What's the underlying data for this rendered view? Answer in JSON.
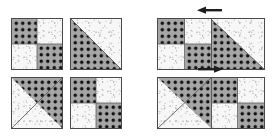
{
  "figure": {
    "background_color": "#ffffff",
    "outline_color": "#4a4a4a",
    "seam_color": "#5a5a5a"
  },
  "fabrics": [
    {
      "id": "dotted",
      "name": "gray-polka-dot",
      "base_color": "#a6a6a6",
      "dot_color": "#141414",
      "description": "medium gray fabric printed with evenly spaced black dots"
    },
    {
      "id": "light",
      "name": "white-speckle",
      "base_color": "#f7f7f7",
      "fleck_color": "#cccccc",
      "description": "white fabric with fine gray speckled texture"
    }
  ],
  "block_types": {
    "four_patch": {
      "name": "Four-Patch Block",
      "quadrants": [
        "dotted",
        "light",
        "light",
        "dotted"
      ]
    },
    "hst_dotted_lower_left": {
      "name": "Half-Square Triangle (dotted lower-left)",
      "triangle_fabric": "dotted",
      "triangle_corner": "bottom-left",
      "background_fabric": "light"
    },
    "hst_dotted_upper_right": {
      "name": "Half-Square Triangle (dotted upper-right)",
      "triangle_fabric": "dotted",
      "triangle_corner": "top-right",
      "background_fabric": "light"
    }
  },
  "left_group": {
    "label": "Individual blocks",
    "blocks": [
      {
        "position": "top-left",
        "type": "four_patch",
        "x": 11,
        "y": 18,
        "size": 52
      },
      {
        "position": "top-right",
        "type": "hst_dotted_lower_left",
        "x": 70,
        "y": 18,
        "size": 52
      },
      {
        "position": "bottom-left",
        "type": "hst_dotted_upper_right",
        "x": 11,
        "y": 77,
        "size": 52
      },
      {
        "position": "bottom-right",
        "type": "four_patch",
        "x": 70,
        "y": 77,
        "size": 52
      }
    ]
  },
  "right_group": {
    "label": "Joined block pairs",
    "pairs": [
      {
        "id": "top-pair",
        "x": 157,
        "y": 18,
        "width": 108,
        "height": 52,
        "left_block": "four_patch",
        "right_block": "hst_dotted_lower_left",
        "arrow": {
          "direction": "left",
          "name": "press-seam-left-arrow",
          "x": 197,
          "y": 5
        }
      },
      {
        "id": "bottom-pair",
        "x": 157,
        "y": 77,
        "width": 108,
        "height": 52,
        "left_block": "hst_dotted_upper_right",
        "right_block": "four_patch",
        "arrow": {
          "direction": "right",
          "name": "press-seam-right-arrow",
          "x": 197,
          "y": 64
        }
      }
    ]
  }
}
